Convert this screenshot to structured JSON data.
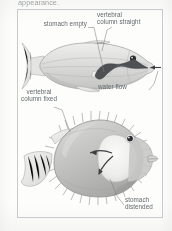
{
  "document": {
    "cut_off_text": "appearance."
  },
  "figure": {
    "name": "pufferfish-inflation-diagram",
    "panels": [
      {
        "id": "deflated",
        "name": "pufferfish-deflated",
        "description": "Pufferfish in normal, uninflated state, facing right"
      },
      {
        "id": "inflated",
        "name": "pufferfish-inflated",
        "description": "Pufferfish inflated into a spiny sphere, facing right"
      }
    ],
    "labels": [
      {
        "id": "stomach-empty",
        "text": "stomach empty",
        "panel": "deflated"
      },
      {
        "id": "vertebral-column-straight",
        "text": "vertebral\ncolumn straight",
        "panel": "deflated"
      },
      {
        "id": "water-flow",
        "text": "water flow",
        "panel": "deflated"
      },
      {
        "id": "vertebral-column-fixed",
        "text": "vertebral\ncolumn fixed",
        "panel": "inflated"
      },
      {
        "id": "stomach-distended",
        "text": "stomach\ndistended",
        "panel": "inflated"
      }
    ]
  },
  "colors": {
    "page_background": "#fdfdfc",
    "frame_border": "#c9ccce",
    "label_text": "#63686c",
    "cut_text": "#8d9296",
    "fish_body_light": "#e2e2e0",
    "fish_body_mid": "#c6c6c4",
    "fish_body_dark": "#a9a9a7",
    "fin_fill": "#ebebe9",
    "outline": "#9a9c9e",
    "stomach_dark": "#4e5053",
    "stomach_light": "#f0f0ee",
    "eye": "#2b2d30",
    "arrow": "#3c3e41",
    "leader_line": "#7d8184"
  }
}
